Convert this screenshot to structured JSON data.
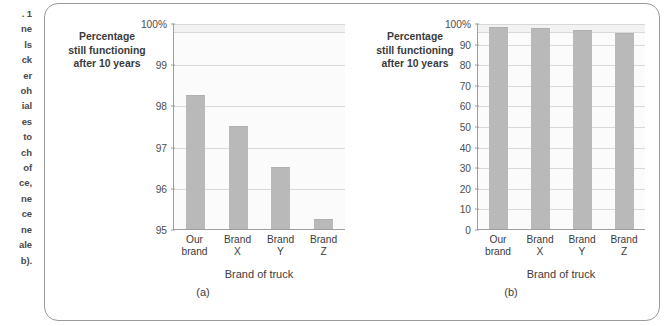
{
  "margin_text": {
    "lines": [
      ". 1",
      "ne",
      "ls",
      "ck",
      "er",
      "oh",
      "ial",
      "es",
      "to",
      "ch",
      "of",
      "ce,",
      "ne",
      "ce",
      "ne",
      "ale",
      "b)."
    ]
  },
  "figure": {
    "colors": {
      "bar_fill": "#b9b9b9",
      "plot_background": "#fbfbfb",
      "gridline": "#d8d8d8",
      "axis": "#9e9e9e",
      "card_border": "#9a9a9a",
      "text": "#3b3b3b"
    }
  },
  "chart_data": [
    {
      "type": "bar",
      "panel": "(a)",
      "title": "",
      "ylabel": "Percentage still functioning after 10 years",
      "ylabel_lines": [
        "Percentage",
        "still functioning",
        "after 10 years"
      ],
      "xlabel": "Brand of truck",
      "categories": [
        "Our brand",
        "Brand X",
        "Brand Y",
        "Brand Z"
      ],
      "category_lines": [
        [
          "Our",
          "brand"
        ],
        [
          "Brand",
          "X"
        ],
        [
          "Brand",
          "Y"
        ],
        [
          "Brand",
          "Z"
        ]
      ],
      "values": [
        98.25,
        97.5,
        96.5,
        95.25
      ],
      "ylim": [
        95,
        100
      ],
      "yticks": [
        100,
        99,
        98,
        97,
        96,
        95
      ],
      "ytick_labels": [
        "100%",
        "99",
        "98",
        "97",
        "96",
        "95"
      ],
      "grid": true,
      "legend": "none"
    },
    {
      "type": "bar",
      "panel": "(b)",
      "title": "",
      "ylabel": "Percentage still functioning after 10 years",
      "ylabel_lines": [
        "Percentage",
        "still functioning",
        "after 10 years"
      ],
      "xlabel": "Brand of truck",
      "categories": [
        "Our brand",
        "Brand X",
        "Brand Y",
        "Brand Z"
      ],
      "category_lines": [
        [
          "Our",
          "brand"
        ],
        [
          "Brand",
          "X"
        ],
        [
          "Brand",
          "Y"
        ],
        [
          "Brand",
          "Z"
        ]
      ],
      "values": [
        98.25,
        97.5,
        96.5,
        95.25
      ],
      "ylim": [
        0,
        100
      ],
      "yticks": [
        100,
        90,
        80,
        70,
        60,
        50,
        40,
        30,
        20,
        10,
        0
      ],
      "ytick_labels": [
        "100%",
        "90",
        "80",
        "70",
        "60",
        "50",
        "40",
        "30",
        "20",
        "10",
        "0"
      ],
      "grid": true,
      "legend": "none"
    }
  ]
}
